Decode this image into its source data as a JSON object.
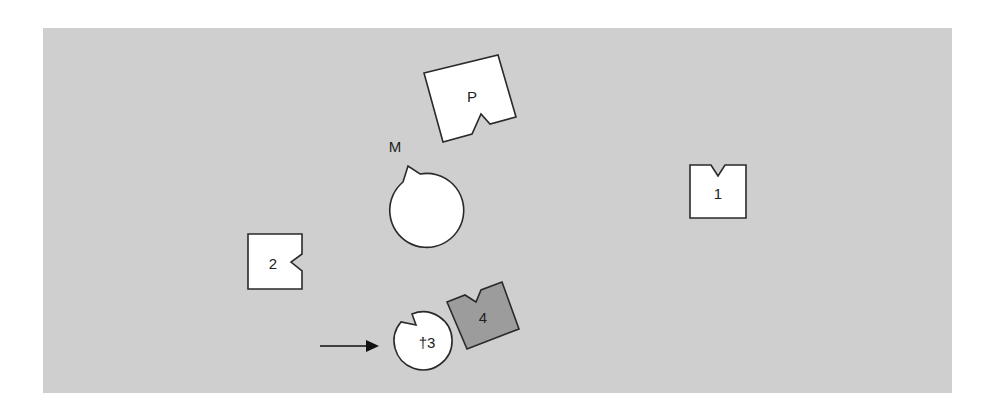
{
  "diagram": {
    "background_color": "#cfcfcf",
    "shapes": [
      {
        "id": "M",
        "label": "M",
        "type": "notched-circle",
        "fill": "#ffffff"
      },
      {
        "id": "P",
        "label": "P",
        "type": "notched-square",
        "fill": "#ffffff"
      },
      {
        "id": "1",
        "label": "1",
        "type": "notched-square",
        "fill": "#ffffff"
      },
      {
        "id": "2",
        "label": "2",
        "type": "notched-square",
        "fill": "#ffffff"
      },
      {
        "id": "3",
        "label": "†3",
        "type": "notched-circle",
        "fill": "#ffffff"
      },
      {
        "id": "4",
        "label": "4",
        "type": "notched-square",
        "fill": "#9c9c9c"
      }
    ],
    "arrow": {
      "direction": "right",
      "points_to": "†3"
    }
  }
}
